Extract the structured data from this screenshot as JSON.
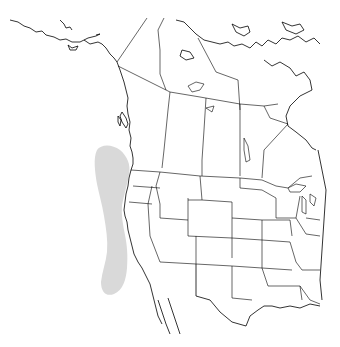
{
  "map": {
    "type": "species-range-map",
    "region": "Western North America",
    "range_color": "#d9d9d9",
    "outline_color": "#000000",
    "background_color": "#ffffff",
    "range_description": "Pacific coastal waters from southern British Columbia to northern Baja California"
  }
}
